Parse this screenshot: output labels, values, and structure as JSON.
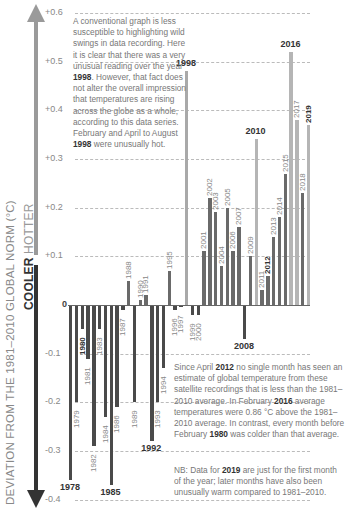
{
  "chart_data": {
    "type": "bar",
    "title": "",
    "xlabel": "",
    "ylabel": "DEVIATION FROM THE 1981–2010 GLOBAL NORM (°C)",
    "ylabel_direction": {
      "up": "HOTTER",
      "down": "COOLER"
    },
    "ylim": [
      -0.4,
      0.6
    ],
    "yticks": [
      "+0.6",
      "+0.5",
      "+0.4",
      "+0.3",
      "+0.2",
      "+0.1",
      "0",
      "-0.1",
      "-0.2",
      "-0.3",
      "-0.4"
    ],
    "grid": true,
    "categories": [
      "1978",
      "1979",
      "1980",
      "1981",
      "1982",
      "1983",
      "1984",
      "1985",
      "1986",
      "1987",
      "1988",
      "1989",
      "1990",
      "1991",
      "1992",
      "1993",
      "1994",
      "1995",
      "1996",
      "1997",
      "1998",
      "1999",
      "2000",
      "2001",
      "2002",
      "2003",
      "2004",
      "2005",
      "2006",
      "2007",
      "2008",
      "2009",
      "2010",
      "2011",
      "2012",
      "2013",
      "2014",
      "2015",
      "2016",
      "2017",
      "2018",
      "2019"
    ],
    "values": [
      -0.36,
      -0.2,
      -0.05,
      -0.11,
      -0.29,
      -0.05,
      -0.23,
      -0.37,
      -0.21,
      -0.01,
      0.05,
      -0.2,
      0.01,
      0.02,
      -0.28,
      -0.2,
      -0.13,
      0.07,
      -0.01,
      -0.005,
      0.48,
      -0.02,
      -0.02,
      0.11,
      0.22,
      0.19,
      0.08,
      0.2,
      0.11,
      0.16,
      -0.07,
      0.1,
      0.34,
      0.03,
      0.06,
      0.14,
      0.18,
      0.27,
      0.52,
      0.38,
      0.23,
      0.37
    ],
    "highlighted_years": [
      "1978",
      "1985",
      "1992",
      "1998",
      "2008",
      "2010",
      "2016"
    ],
    "bold_label_years": [
      "1980",
      "2012",
      "2019"
    ],
    "colors": {
      "negative": "#4a4a4a",
      "positive_low": "#6a6a6a",
      "positive_high": "#b5b5b5"
    },
    "annotations": [
      "A conventional graph is less susceptible to highlighting wild swings in data recording. Here it is clear that there was a very unusual reading over the year 1998. However, that fact does not alter the overall impression that temperatures are rising across the globe as a whole, according to this data series. February and April to August 1998 were unusually hot.",
      "Since April 2012 no single month has seen an estimate of global temperature from these satellite recordings that is less than the 1981–2010 average. In February 2016 average temperatures were 0.86 °C above the 1981–2010 average. In contrast, every month before February 1980 was colder than that average.",
      "NB: Data for 2019 are just for the first month of the year; later months have also been unusually warm compared to 1981–2010."
    ]
  },
  "axis": {
    "label_main": "DEVIATION FROM THE 1981–2010 GLOBAL NORM (°C)",
    "cooler": "COOLER",
    "hotter": "HOTTER"
  },
  "notes": {
    "top": {
      "p1": "A conventional graph is less susceptible to highlighting wild swings in data recording. Here it is clear that there was a very unusual reading over the year ",
      "y1": "1998",
      "p2": ". However, that fact does not alter the overall impression that temperatures are rising across the globe as a whole, according to this data series. February and April to August ",
      "y2": "1998",
      "p3": " were unusually hot."
    },
    "mid": {
      "p1": "Since April ",
      "y1": "2012",
      "p2": " no single month has seen an estimate of global temperature from these satellite recordings that is less than the 1981–2010 average. In February ",
      "y2": "2016",
      "p3": " average temperatures were 0.86 °C above the 1981–2010 average. In contrast, every month before February ",
      "y3": "1980",
      "p4": " was colder than that average."
    },
    "nb": {
      "p1": "NB: Data for ",
      "y1": "2019",
      "p2": " are just for the first month of the year; later months have also been unusually warm compared to 1981–2010."
    }
  }
}
